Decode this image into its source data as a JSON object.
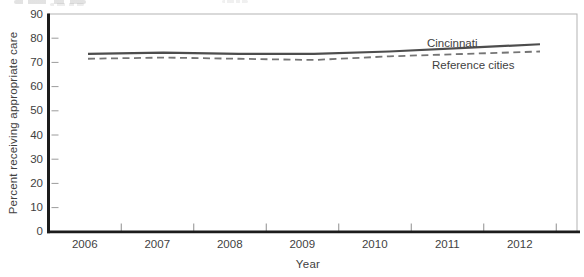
{
  "figure": {
    "background": "#ffffff",
    "axis_color": "#1c1c1c",
    "border_color": "#b3b3b3",
    "tick_color": "#8f8f8f",
    "text_color": "#3f3f3f"
  },
  "chart_data": {
    "type": "line",
    "title": "",
    "xlabel": "Year",
    "ylabel": "Percent receiving appropriate care",
    "x": [
      2006,
      2007,
      2008,
      2009,
      2010,
      2011,
      2012
    ],
    "xtick_labels": [
      "2006",
      "2007",
      "2008",
      "2009",
      "2010",
      "2011",
      "2012"
    ],
    "ytick_labels_desc": [
      "90",
      "80",
      "70",
      "60",
      "50",
      "40",
      "30",
      "20",
      "10",
      "0"
    ],
    "ylim": [
      0,
      90
    ],
    "grid": false,
    "legend_position": "inline-labels-right",
    "series": [
      {
        "name": "Cincinnati",
        "line_style": "solid",
        "color": "#4d4d4d",
        "values": [
          73.5,
          74,
          73.5,
          73.5,
          74.5,
          76,
          77.5
        ]
      },
      {
        "name": "Reference cities",
        "line_style": "dashed",
        "color": "#757575",
        "values": [
          71.5,
          72,
          71.5,
          71,
          72.5,
          73.5,
          74.5
        ]
      }
    ]
  }
}
